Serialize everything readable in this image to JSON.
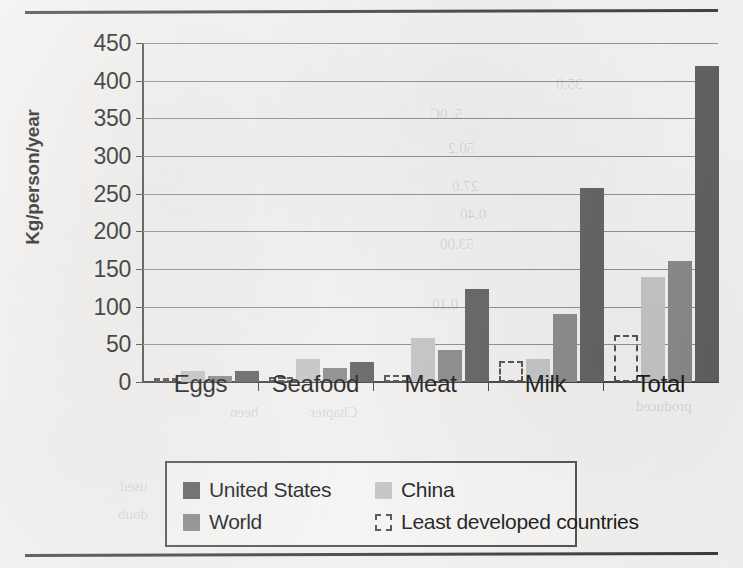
{
  "figure": {
    "y_axis_title": "Kg/person/year"
  },
  "chart_data": {
    "type": "bar",
    "title": "",
    "xlabel": "",
    "ylabel": "Kg/person/year",
    "ylim": [
      0,
      450
    ],
    "yticks": [
      0,
      50,
      100,
      150,
      200,
      250,
      300,
      350,
      400,
      450
    ],
    "grid": true,
    "legend_position": "bottom",
    "categories": [
      "Eggs",
      "Seafood",
      "Meat",
      "Milk",
      "Total"
    ],
    "series": [
      {
        "name": "Least developed countries",
        "style": "dashed-outline",
        "color": "#4a4a4a",
        "values": [
          2,
          7,
          9,
          28,
          63
        ]
      },
      {
        "name": "China",
        "style": "filled",
        "color": "#c3c3c3",
        "values": [
          15,
          31,
          58,
          30,
          139
        ]
      },
      {
        "name": "World",
        "style": "filled",
        "color": "#868686",
        "values": [
          8,
          18,
          42,
          90,
          160
        ]
      },
      {
        "name": "United States",
        "style": "filled",
        "color": "#5c5c5c",
        "values": [
          15,
          26,
          123,
          258,
          419
        ]
      }
    ]
  },
  "legend": {
    "items": [
      {
        "label": "United States",
        "swatch": "us"
      },
      {
        "label": "China",
        "swatch": "china"
      },
      {
        "label": "World",
        "swatch": "world"
      },
      {
        "label": "Least developed countries",
        "swatch": "ldc"
      }
    ]
  },
  "page_bleed": [
    {
      "text": "35.0",
      "x": 556,
      "y": 76
    },
    {
      "text": "5. 0C",
      "x": 430,
      "y": 106
    },
    {
      "text": "50.2",
      "x": 448,
      "y": 140
    },
    {
      "text": "27.0",
      "x": 452,
      "y": 178
    },
    {
      "text": "0.40",
      "x": 460,
      "y": 206
    },
    {
      "text": "53.00",
      "x": 440,
      "y": 236
    },
    {
      "text": "0.10",
      "x": 432,
      "y": 296
    },
    {
      "text": "Chapter",
      "x": 310,
      "y": 404
    },
    {
      "text": "been",
      "x": 230,
      "y": 404
    },
    {
      "text": "produced",
      "x": 636,
      "y": 398
    },
    {
      "text": "used",
      "x": 120,
      "y": 478
    },
    {
      "text": "doub",
      "x": 118,
      "y": 506
    }
  ]
}
